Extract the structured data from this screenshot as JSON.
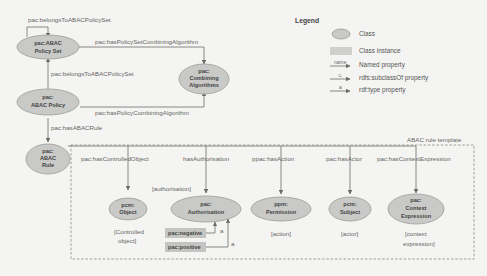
{
  "legend": {
    "title": "Legend",
    "items": [
      {
        "symbol": "ellipse",
        "label": "Class"
      },
      {
        "symbol": "rect",
        "label": "Class instance"
      },
      {
        "symbol": "arrow",
        "arrow_text": "name",
        "label": "Named property"
      },
      {
        "symbol": "arrow",
        "arrow_text": "⊆",
        "label": "rdfs:subclassOf property"
      },
      {
        "symbol": "arrow",
        "arrow_text": "a",
        "label": "rdf:type property"
      }
    ]
  },
  "nodes": {
    "policy_set": {
      "line1": "pac:ABAC",
      "line2": "Policy Set"
    },
    "combining": {
      "line1": "pac:",
      "line2": "Combining",
      "line3": "Algorithms"
    },
    "policy": {
      "line1": "pac:",
      "line2": "ABAC Policy"
    },
    "rule": {
      "line1": "pac:",
      "line2": "ABAC",
      "line3": "Rule"
    },
    "object": {
      "line1": "pcm:",
      "line2": "Object"
    },
    "authorisation": {
      "line1": "pac:",
      "line2": "Authorisation"
    },
    "permission": {
      "line1": "ppm:",
      "line2": "Permission"
    },
    "subject": {
      "line1": "pcm:",
      "line2": "Subject"
    },
    "context": {
      "line1": "pac:",
      "line2": "Context",
      "line3": "Expression"
    }
  },
  "instances": {
    "negative": "pac:negative",
    "positive": "pac:positive"
  },
  "edges": {
    "self_loop": "pac:belongsToABACPolicySet",
    "set_combining": "pac:hasPolicySetCombiningAlgorithm",
    "policy_to_set": "pac:belongsToABACPolicySet",
    "policy_combining": "pac:hasPolicyCombiningAlgorithm",
    "has_rule": "pac:hasABACRule",
    "controlled_object": "pac:hasControlledObject",
    "authorisation": "hasAuthorisation",
    "action": "ppac:hasAction",
    "actor": "pac:hasActor",
    "context": "pac:hasContextExpression",
    "type_a1": "a",
    "type_a2": "a"
  },
  "template": {
    "title": "ABAC rule template",
    "notes": {
      "authorisation": "[authorisation]",
      "object_1": "[Controlled",
      "object_2": "object]",
      "action": "[action]",
      "actor": "[actor]",
      "context_1": "[context",
      "context_2": "expression]"
    }
  }
}
